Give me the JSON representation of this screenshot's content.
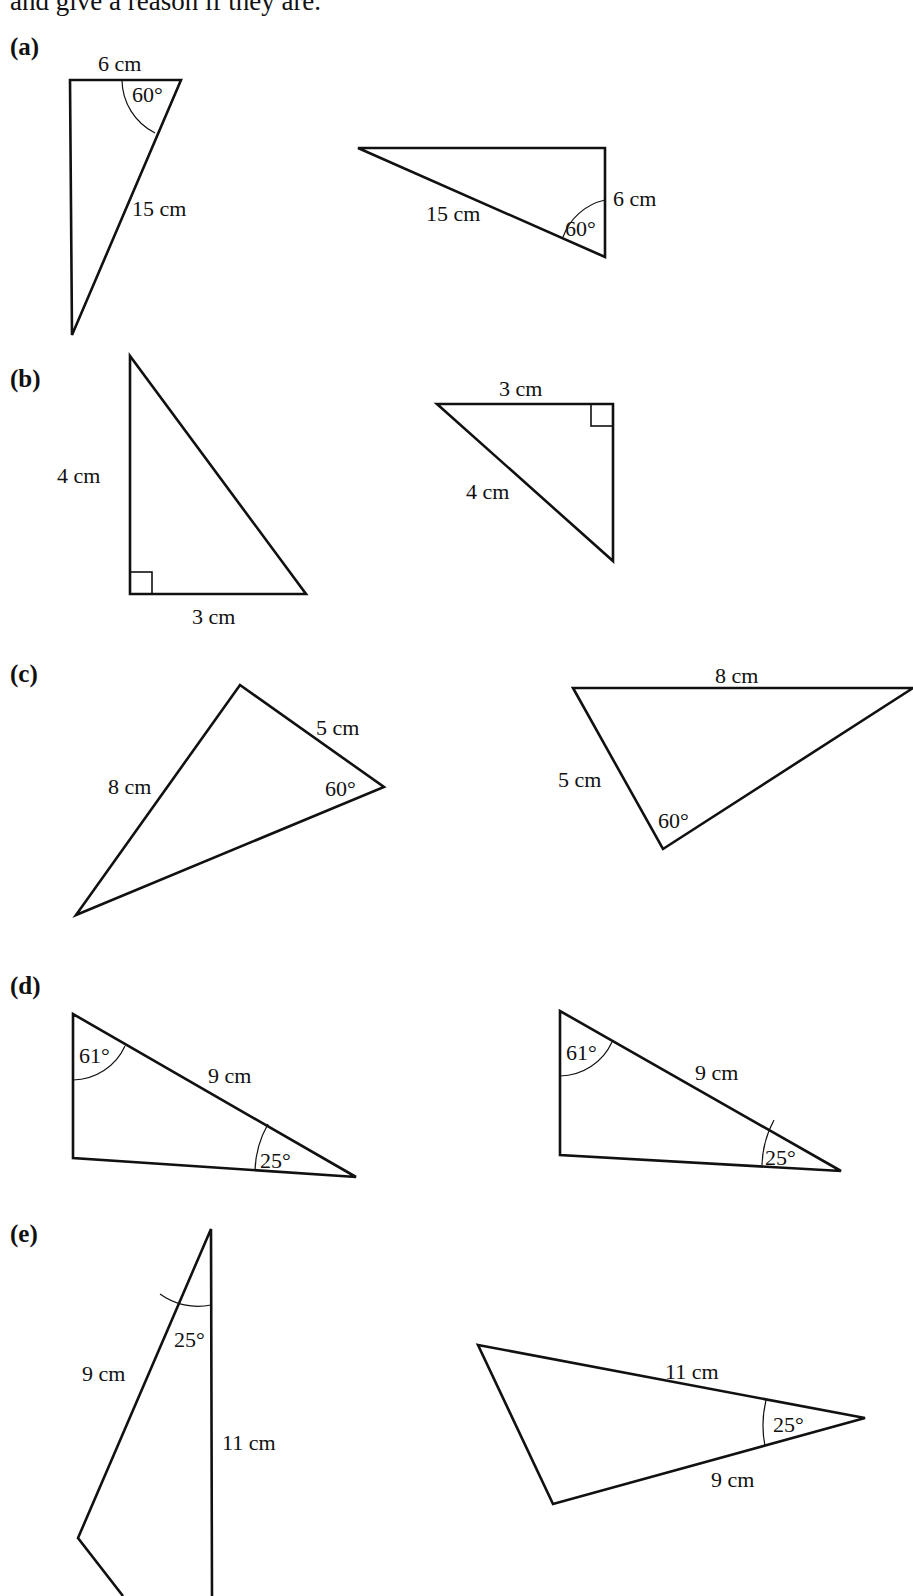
{
  "question": {
    "intro_text": "and give a reason if they are."
  },
  "parts": [
    {
      "label": "(a)",
      "left_triangle": {
        "side_top": "6 cm",
        "side_slant": "15 cm",
        "angle": "60°"
      },
      "right_triangle": {
        "side_slant": "15 cm",
        "side_right": "6 cm",
        "angle": "60°"
      }
    },
    {
      "label": "(b)",
      "left_triangle": {
        "side_vertical": "4 cm",
        "side_bottom": "3 cm",
        "right_angle": true
      },
      "right_triangle": {
        "side_top": "3 cm",
        "side_slant": "4 cm",
        "right_angle": true
      }
    },
    {
      "label": "(c)",
      "left_triangle": {
        "side_left": "8 cm",
        "side_right": "5 cm",
        "angle": "60°"
      },
      "right_triangle": {
        "side_top": "8 cm",
        "side_left": "5 cm",
        "angle": "60°"
      }
    },
    {
      "label": "(d)",
      "left_triangle": {
        "angle_top": "61°",
        "side_hyp": "9 cm",
        "angle_right": "25°"
      },
      "right_triangle": {
        "angle_top": "61°",
        "side_hyp": "9 cm",
        "angle_right": "25°"
      }
    },
    {
      "label": "(e)",
      "left_triangle": {
        "angle_top": "25°",
        "side_left": "9 cm",
        "side_right": "11 cm"
      },
      "right_triangle": {
        "side_top": "11 cm",
        "side_bottom": "9 cm",
        "angle_right": "25°"
      }
    }
  ]
}
